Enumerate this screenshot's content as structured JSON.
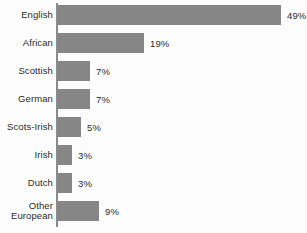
{
  "chart_data": {
    "type": "bar",
    "orientation": "horizontal",
    "title": "",
    "subtitle": "",
    "xlabel": "",
    "ylabel": "",
    "categories": [
      "English",
      "African",
      "Scottish",
      "German",
      "Scots-Irish",
      "Irish",
      "Dutch",
      "Other European"
    ],
    "values": [
      49,
      19,
      7,
      7,
      5,
      3,
      3,
      9
    ],
    "value_labels": [
      "49%",
      "19%",
      "7%",
      "7%",
      "5%",
      "3%",
      "3%",
      "9%"
    ],
    "unit": "%",
    "xlim": [
      0,
      49
    ],
    "grid": false,
    "legend": null,
    "bar_color": "#868686",
    "axis_color": "#8a8a8a",
    "text_color": "#2b2b2b",
    "background_color": "#fdfdfd"
  },
  "rows": [
    {
      "label_line1": "English",
      "label_line2": "",
      "value": 49,
      "value_label": "49%"
    },
    {
      "label_line1": "African",
      "label_line2": "",
      "value": 19,
      "value_label": "19%"
    },
    {
      "label_line1": "Scottish",
      "label_line2": "",
      "value": 7,
      "value_label": "7%"
    },
    {
      "label_line1": "German",
      "label_line2": "",
      "value": 7,
      "value_label": "7%"
    },
    {
      "label_line1": "Scots-Irish",
      "label_line2": "",
      "value": 5,
      "value_label": "5%"
    },
    {
      "label_line1": "Irish",
      "label_line2": "",
      "value": 3,
      "value_label": "3%"
    },
    {
      "label_line1": "Dutch",
      "label_line2": "",
      "value": 3,
      "value_label": "3%"
    },
    {
      "label_line1": "Other",
      "label_line2": "European",
      "value": 9,
      "value_label": "9%"
    }
  ]
}
